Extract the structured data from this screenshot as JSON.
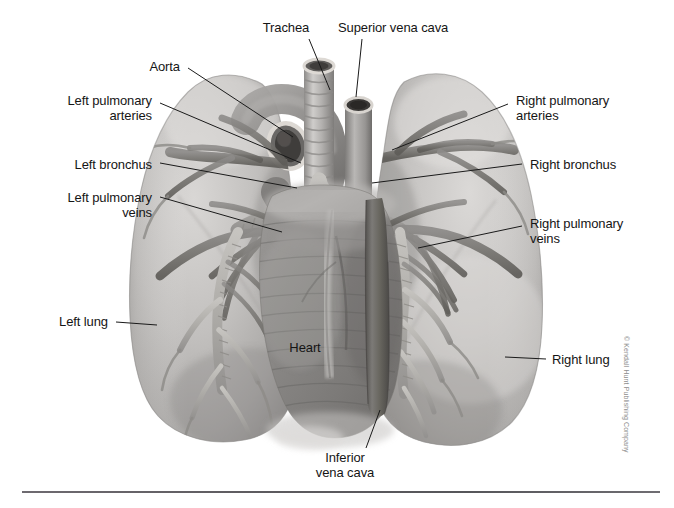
{
  "figure": {
    "background_color": "#ffffff",
    "tissue_light": "#cfcdcb",
    "tissue_mid": "#a7a5a4",
    "tissue_dark": "#6f6d6d",
    "vessel_dark": "#6a6868",
    "line_color": "#1a1a1a",
    "width": 674,
    "height": 508
  },
  "labels": [
    {
      "id": "trachea",
      "text": "Trachea",
      "align": "center",
      "x": 240,
      "y": 20,
      "width": 92,
      "leader": {
        "x1": 309,
        "y1": 39,
        "x2": 330,
        "y2": 90
      }
    },
    {
      "id": "superior-vena-cava",
      "text": "Superior vena cava",
      "align": "left",
      "x": 338,
      "y": 20,
      "width": 160,
      "leader": {
        "x1": 362,
        "y1": 39,
        "x2": 356,
        "y2": 97
      }
    },
    {
      "id": "aorta",
      "text": "Aorta",
      "align": "right",
      "x": 118,
      "y": 59,
      "width": 62,
      "leader": {
        "x1": 188,
        "y1": 68,
        "x2": 293,
        "y2": 137
      }
    },
    {
      "id": "left-pulmonary-arteries",
      "text": "Left pulmonary\narteries",
      "align": "right",
      "x": 20,
      "y": 93,
      "width": 132,
      "leader": {
        "x1": 160,
        "y1": 103,
        "x2": 301,
        "y2": 163
      }
    },
    {
      "id": "right-pulmonary-arteries",
      "text": "Right pulmonary\narteries",
      "align": "left",
      "x": 516,
      "y": 93,
      "width": 140,
      "leader": {
        "x1": 508,
        "y1": 104,
        "x2": 392,
        "y2": 150
      }
    },
    {
      "id": "left-bronchus",
      "text": "Left bronchus",
      "align": "right",
      "x": 22,
      "y": 157,
      "width": 130,
      "leader": {
        "x1": 160,
        "y1": 163,
        "x2": 297,
        "y2": 188
      }
    },
    {
      "id": "right-bronchus",
      "text": "Right bronchus",
      "align": "left",
      "x": 530,
      "y": 157,
      "width": 130,
      "leader": {
        "x1": 522,
        "y1": 164,
        "x2": 372,
        "y2": 183
      }
    },
    {
      "id": "left-pulmonary-veins",
      "text": "Left pulmonary\nveins",
      "align": "right",
      "x": 20,
      "y": 190,
      "width": 132,
      "leader": {
        "x1": 160,
        "y1": 197,
        "x2": 282,
        "y2": 232
      }
    },
    {
      "id": "right-pulmonary-veins",
      "text": "Right pulmonary\nveins",
      "align": "left",
      "x": 530,
      "y": 216,
      "width": 140,
      "leader": {
        "x1": 522,
        "y1": 226,
        "x2": 418,
        "y2": 248
      }
    },
    {
      "id": "left-lung",
      "text": "Left lung",
      "align": "right",
      "x": 22,
      "y": 314,
      "width": 86,
      "leader": {
        "x1": 116,
        "y1": 322,
        "x2": 157,
        "y2": 325
      }
    },
    {
      "id": "right-lung",
      "text": "Right lung",
      "align": "left",
      "x": 552,
      "y": 352,
      "width": 96,
      "leader": {
        "x1": 546,
        "y1": 359,
        "x2": 505,
        "y2": 357
      }
    },
    {
      "id": "heart",
      "text": "Heart",
      "align": "center",
      "x": 278,
      "y": 340,
      "width": 54,
      "leader": null
    },
    {
      "id": "inferior-vena-cava",
      "text": "Inferior\nvena cava",
      "align": "center",
      "x": 303,
      "y": 450,
      "width": 84,
      "leader": {
        "x1": 366,
        "y1": 448,
        "x2": 380,
        "y2": 410
      }
    }
  ],
  "copyright": {
    "text": "© Kendall Hunt Publishing Company"
  }
}
